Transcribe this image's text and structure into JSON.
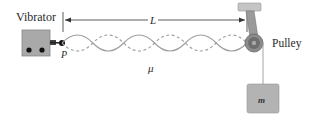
{
  "diagram": {
    "type": "standing-wave-apparatus",
    "labels": {
      "vibrator": "Vibrator",
      "pulley": "Pulley",
      "length": "L",
      "linear_density": "μ",
      "point": "P",
      "mass": "m"
    },
    "wave": {
      "loops": 6,
      "x_start": 62,
      "x_end": 247,
      "center_y": 43,
      "amplitude": 8
    },
    "colors": {
      "vibrator_fill": "#a9a9a9",
      "string": "#9e9e9e",
      "mass_fill": "#b3b3b3",
      "pulley_outer": "#8c8c8c",
      "mount": "#c4c4c4",
      "line": "#333333"
    }
  }
}
